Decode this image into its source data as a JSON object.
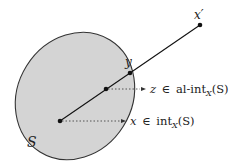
{
  "diagram": {
    "set_label": "S",
    "points": {
      "x": {
        "label": "x",
        "cx": 60,
        "cy": 121
      },
      "z": {
        "label": "z",
        "cx": 106,
        "cy": 89
      },
      "y": {
        "label": "y",
        "cx": 130,
        "cy": 73
      },
      "x_prime": {
        "label": "x′",
        "cx": 200,
        "cy": 25
      }
    },
    "annotations": {
      "z_membership": {
        "var": "z",
        "rel": "∈",
        "op": "al-int",
        "sub": "X",
        "arg": "(S)"
      },
      "x_membership": {
        "var": "x",
        "rel": "∈",
        "op": "int",
        "sub": "X",
        "arg": "(S)"
      }
    },
    "colors": {
      "fill": "#d4d4d4",
      "stroke": "#333333",
      "point": "#111111"
    }
  }
}
